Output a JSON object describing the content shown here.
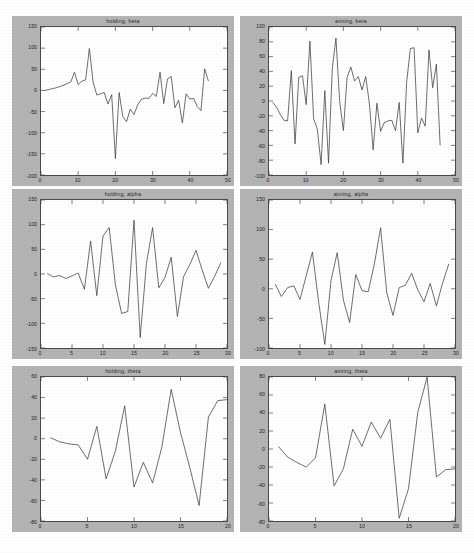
{
  "figure": {
    "background_color": "#ffffff",
    "panel_color": "#b4b4b4",
    "axes_color": "#4a4a4a",
    "line_color": "#3c3c3c",
    "width": 474,
    "height": 553
  },
  "chart_data": [
    {
      "id": "holding-beta",
      "type": "line",
      "title": "holding,  beta",
      "xlabel": "",
      "ylabel": "",
      "xlim": [
        0,
        50
      ],
      "ylim": [
        -200,
        150
      ],
      "xticks": [
        0,
        10,
        20,
        30,
        40,
        50
      ],
      "xticklabels": [
        "0",
        "10",
        "20",
        "30",
        "40",
        "50"
      ],
      "yticks": [
        -200,
        -150,
        -100,
        -50,
        0,
        50,
        100,
        150
      ],
      "yticklabels": [
        "-200",
        "-150",
        "-100",
        "-50",
        "0",
        "50",
        "100",
        "150"
      ],
      "grid": false,
      "legend": null,
      "x": [
        1,
        2,
        3,
        4,
        5,
        6,
        7,
        8,
        9,
        10,
        11,
        12,
        13,
        14,
        15,
        16,
        17,
        18,
        19,
        20,
        21,
        22,
        23,
        24,
        25,
        26,
        27,
        28,
        29,
        30,
        31,
        32,
        33,
        34,
        35,
        36,
        37,
        38,
        39,
        40,
        41,
        42,
        43,
        44,
        45
      ],
      "values": [
        0,
        2,
        4,
        6,
        9,
        12,
        16,
        20,
        43,
        14,
        22,
        25,
        99,
        20,
        -11,
        -8,
        -5,
        -32,
        -10,
        -161,
        -5,
        -62,
        -74,
        -44,
        -57,
        -34,
        -21,
        -18,
        -19,
        -7,
        -14,
        43,
        -31,
        27,
        33,
        -41,
        -23,
        -77,
        -8,
        -20,
        -19,
        -38,
        -48,
        51,
        22
      ]
    },
    {
      "id": "aiming-beta",
      "type": "line",
      "title": "aiming,  beta",
      "xlabel": "",
      "ylabel": "",
      "xlim": [
        0,
        50
      ],
      "ylim": [
        -100,
        100
      ],
      "xticks": [
        0,
        10,
        20,
        30,
        40,
        50
      ],
      "xticklabels": [
        "0",
        "10",
        "20",
        "30",
        "40",
        "50"
      ],
      "yticks": [
        -100,
        -80,
        -60,
        -40,
        -20,
        0,
        20,
        40,
        60,
        80,
        100
      ],
      "yticklabels": [
        "-100",
        "-80",
        "-60",
        "-40",
        "-20",
        "0",
        "20",
        "40",
        "60",
        "80",
        "100"
      ],
      "grid": false,
      "legend": null,
      "x": [
        1,
        2,
        3,
        4,
        5,
        6,
        7,
        8,
        9,
        10,
        11,
        12,
        13,
        14,
        15,
        16,
        17,
        18,
        19,
        20,
        21,
        22,
        23,
        24,
        25,
        26,
        27,
        28,
        29,
        30,
        31,
        32,
        33,
        34,
        35,
        36,
        37,
        38,
        39,
        40,
        41,
        42,
        43,
        44,
        45,
        46
      ],
      "values": [
        -2,
        -8,
        -18,
        -26,
        -27,
        41,
        -58,
        32,
        34,
        -5,
        81,
        -24,
        -38,
        -86,
        14,
        -84,
        43,
        85,
        -1,
        -40,
        32,
        46,
        27,
        33,
        15,
        33,
        -4,
        -66,
        -3,
        -41,
        -29,
        -27,
        -26,
        -40,
        -2,
        -84,
        25,
        71,
        72,
        -43,
        -23,
        -34,
        69,
        18,
        50,
        -60
      ]
    },
    {
      "id": "holding-alpha",
      "type": "line",
      "title": "holding,  alpha",
      "xlabel": "",
      "ylabel": "",
      "xlim": [
        0,
        30
      ],
      "ylim": [
        -150,
        150
      ],
      "xticks": [
        0,
        5,
        10,
        15,
        20,
        25,
        30
      ],
      "xticklabels": [
        "0",
        "5",
        "10",
        "15",
        "20",
        "25",
        "30"
      ],
      "yticks": [
        -150,
        -100,
        -50,
        0,
        50,
        100,
        150
      ],
      "yticklabels": [
        "-150",
        "-100",
        "-50",
        "0",
        "50",
        "100",
        "150"
      ],
      "grid": false,
      "legend": null,
      "x": [
        1,
        2,
        3,
        4,
        5,
        6,
        7,
        8,
        9,
        10,
        11,
        12,
        13,
        14,
        15,
        16,
        17,
        18,
        19,
        20,
        21,
        22,
        23,
        24,
        25,
        26,
        27,
        28,
        29
      ],
      "values": [
        1,
        -6,
        -3,
        -9,
        -4,
        2,
        -31,
        67,
        -44,
        77,
        94,
        -22,
        -80,
        -76,
        109,
        -129,
        21,
        94,
        -28,
        -7,
        34,
        -86,
        -5,
        19,
        48,
        8,
        -29,
        -5,
        23
      ]
    },
    {
      "id": "aiming-alpha",
      "type": "line",
      "title": "aiming,  alpha",
      "xlabel": "",
      "ylabel": "",
      "xlim": [
        0,
        30
      ],
      "ylim": [
        -100,
        150
      ],
      "xticks": [
        0,
        5,
        10,
        15,
        20,
        25,
        30
      ],
      "xticklabels": [
        "0",
        "5",
        "10",
        "15",
        "20",
        "25",
        "30"
      ],
      "yticks": [
        -100,
        -50,
        0,
        50,
        100,
        150
      ],
      "yticklabels": [
        "-100",
        "-50",
        "0",
        "50",
        "100",
        "150"
      ],
      "grid": false,
      "legend": null,
      "x": [
        1,
        2,
        3,
        4,
        5,
        6,
        7,
        8,
        9,
        10,
        11,
        12,
        13,
        14,
        15,
        16,
        17,
        18,
        19,
        20,
        21,
        22,
        23,
        24,
        25,
        26,
        27,
        28,
        29
      ],
      "values": [
        8,
        -13,
        2,
        5,
        -18,
        22,
        62,
        -22,
        -94,
        14,
        61,
        -19,
        -57,
        24,
        -3,
        -5,
        42,
        103,
        -7,
        -45,
        2,
        6,
        26,
        -2,
        -22,
        9,
        -29,
        10,
        42
      ]
    },
    {
      "id": "holding-theta",
      "type": "line",
      "title": "holding,  theta",
      "xlabel": "",
      "ylabel": "",
      "xlim": [
        0,
        20
      ],
      "ylim": [
        -80,
        60
      ],
      "xticks": [
        0,
        5,
        10,
        15,
        20
      ],
      "xticklabels": [
        "0",
        "5",
        "10",
        "15",
        "20"
      ],
      "yticks": [
        -80,
        -60,
        -40,
        -20,
        0,
        20,
        40,
        60
      ],
      "yticklabels": [
        "-80",
        "-60",
        "-40",
        "-20",
        "0",
        "20",
        "40",
        "60"
      ],
      "grid": false,
      "legend": null,
      "x": [
        1,
        2,
        3,
        4,
        5,
        6,
        7,
        8,
        9,
        10,
        11,
        12,
        13,
        14,
        15,
        16,
        17,
        18,
        19,
        20
      ],
      "values": [
        1,
        -3,
        -5,
        -6,
        -20,
        12,
        -39,
        -12,
        32,
        -47,
        -23,
        -43,
        -8,
        48,
        6,
        -28,
        -65,
        21,
        37,
        38
      ]
    },
    {
      "id": "aiming-theta",
      "type": "line",
      "title": "aiming,  theta",
      "xlabel": "",
      "ylabel": "",
      "xlim": [
        0,
        20
      ],
      "ylim": [
        -80,
        80
      ],
      "xticks": [
        0,
        5,
        10,
        15,
        20
      ],
      "xticklabels": [
        "0",
        "5",
        "10",
        "15",
        "20"
      ],
      "yticks": [
        -80,
        -60,
        -40,
        -20,
        0,
        20,
        40,
        60,
        80
      ],
      "yticklabels": [
        "-80",
        "-60",
        "-40",
        "-20",
        "0",
        "20",
        "40",
        "60",
        "80"
      ],
      "grid": false,
      "legend": null,
      "x": [
        1,
        2,
        3,
        4,
        5,
        6,
        7,
        8,
        9,
        10,
        11,
        12,
        13,
        14,
        15,
        16,
        17,
        18,
        19,
        20
      ],
      "values": [
        3,
        -9,
        -15,
        -20,
        -10,
        50,
        -41,
        -22,
        22,
        3,
        30,
        12,
        33,
        -77,
        -44,
        41,
        80,
        -31,
        -23,
        -22
      ]
    }
  ]
}
